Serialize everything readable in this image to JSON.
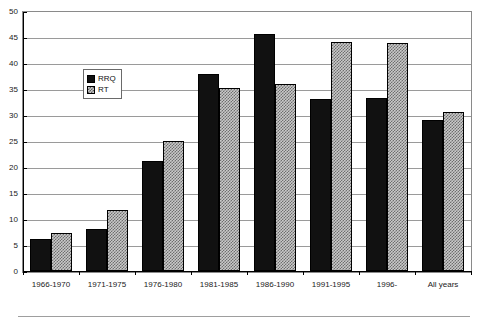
{
  "chart_data": {
    "type": "bar",
    "title": "",
    "xlabel": "",
    "ylabel": "",
    "ylim": [
      0,
      50
    ],
    "ytick_step": 5,
    "yticks": [
      0,
      5,
      10,
      15,
      20,
      25,
      30,
      35,
      40,
      45,
      50
    ],
    "grid": true,
    "legend_position": "upper-left-inside",
    "categories": [
      "1966-1970",
      "1971-1975",
      "1976-1980",
      "1981-1985",
      "1986-1990",
      "1991-1995",
      "1996-",
      "All years"
    ],
    "series": [
      {
        "name": "RRQ",
        "color": "#111111",
        "pattern": "solid",
        "values": [
          6.2,
          8.0,
          21.2,
          37.8,
          45.5,
          33.0,
          33.2,
          29.0
        ]
      },
      {
        "name": "RT",
        "color": "#c9c9c9",
        "pattern": "hatched",
        "values": [
          7.4,
          11.7,
          25.0,
          35.2,
          36.0,
          44.0,
          43.8,
          30.5
        ]
      }
    ]
  },
  "legend": {
    "items": [
      {
        "label": "RRQ"
      },
      {
        "label": "RT"
      }
    ]
  }
}
